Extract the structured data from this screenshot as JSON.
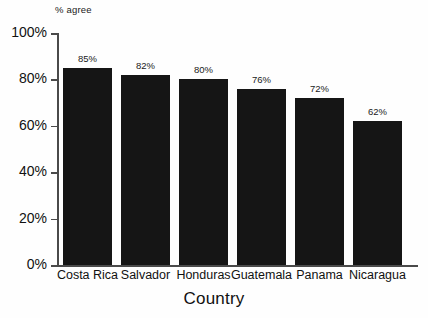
{
  "chart_data": {
    "type": "bar",
    "title": "",
    "categories": [
      "Costa Rica",
      "Salvador",
      "Honduras",
      "Guatemala",
      "Panama",
      "Nicaragua"
    ],
    "values": [
      85,
      82,
      80,
      76,
      72,
      62
    ],
    "value_labels": [
      "85%",
      "82%",
      "80%",
      "76%",
      "72%",
      "62%"
    ],
    "xlabel": "Country",
    "ylabel": "% agree",
    "ylim": [
      0,
      100
    ],
    "ytick_values": [
      0,
      20,
      40,
      60,
      80,
      100
    ],
    "ytick_labels": [
      "0%",
      "20%",
      "40%",
      "60%",
      "80%",
      "100%"
    ],
    "grid": false,
    "legend": "none",
    "bar_color": "#151515",
    "axis_color": "#4a4a4a",
    "background_color": "#fefefe"
  }
}
